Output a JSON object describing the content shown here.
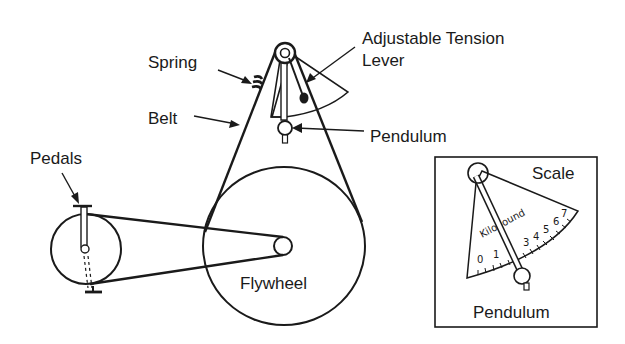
{
  "diagram": {
    "labels": {
      "spring": "Spring",
      "belt": "Belt",
      "adjustable_tension_line1": "Adjustable Tension",
      "adjustable_tension_line2": "Lever",
      "pendulum": "Pendulum",
      "pedals": "Pedals",
      "flywheel": "Flywheel"
    },
    "inset": {
      "title": "Scale",
      "pendulum_label": "Pendulum",
      "unit_label": "Kilopound",
      "scale_numbers": [
        "0",
        "1",
        "3",
        "4",
        "5",
        "6",
        "7"
      ]
    },
    "colors": {
      "ink": "#1a1a1a",
      "background": "#ffffff"
    }
  }
}
